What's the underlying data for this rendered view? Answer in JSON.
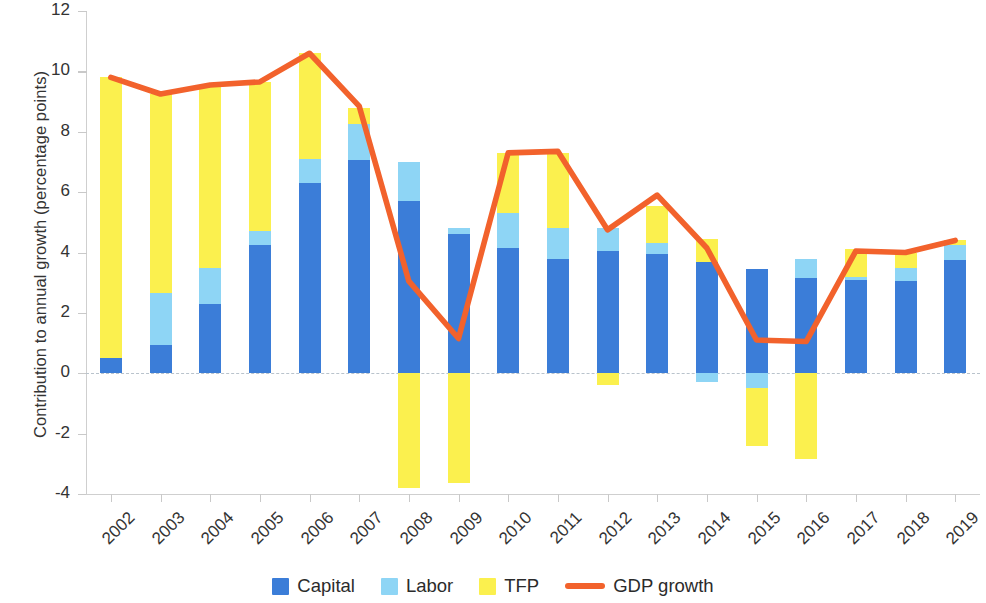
{
  "chart_data": {
    "type": "bar",
    "subtype": "stacked-bar-with-line",
    "title": "",
    "xlabel": "",
    "ylabel": "Contribution to annual growth (percentage points)",
    "ylim": [
      -4,
      12
    ],
    "yticks": [
      -4,
      -2,
      0,
      2,
      4,
      6,
      8,
      10,
      12
    ],
    "ytick_labels": [
      "-4",
      "-2",
      "0",
      "2",
      "4",
      "6",
      "8",
      "10",
      "12"
    ],
    "grid": false,
    "zero_line": true,
    "legend_position": "bottom",
    "categories": [
      "2002",
      "2003",
      "2004",
      "2005",
      "2006",
      "2007",
      "2008",
      "2009",
      "2010",
      "2011",
      "2012",
      "2013",
      "2014",
      "2015",
      "2016",
      "2017",
      "2018",
      "2019"
    ],
    "series": [
      {
        "name": "Capital",
        "type": "bar",
        "color": "#3b7dd8",
        "values": [
          0.5,
          0.95,
          2.3,
          4.25,
          6.3,
          7.05,
          5.7,
          4.6,
          4.15,
          3.8,
          4.05,
          3.95,
          3.7,
          3.45,
          3.15,
          3.1,
          3.05,
          3.75
        ]
      },
      {
        "name": "Labor",
        "type": "bar",
        "color": "#8ed5f5",
        "values": [
          0.0,
          1.7,
          1.2,
          0.45,
          0.8,
          1.2,
          1.3,
          0.2,
          1.15,
          1.0,
          0.75,
          0.35,
          -0.3,
          -0.5,
          0.65,
          0.1,
          0.45,
          0.5
        ]
      },
      {
        "name": "TFP",
        "type": "bar",
        "color": "#fbf04e",
        "values": [
          9.3,
          6.6,
          6.05,
          4.95,
          3.5,
          0.55,
          -3.8,
          -3.65,
          2.0,
          2.5,
          -0.4,
          1.25,
          0.75,
          -1.9,
          -2.85,
          0.9,
          0.5,
          0.15
        ]
      },
      {
        "name": "GDP growth",
        "type": "line",
        "color": "#f2622c",
        "values": [
          9.8,
          9.25,
          9.55,
          9.65,
          10.6,
          8.85,
          3.05,
          1.15,
          7.3,
          7.35,
          4.75,
          5.9,
          4.15,
          1.1,
          1.05,
          4.05,
          4.0,
          4.4
        ]
      }
    ]
  },
  "legend": {
    "items": [
      {
        "label": "Capital",
        "marker": "square-swatch",
        "color": "#3b7dd8"
      },
      {
        "label": "Labor",
        "marker": "square-swatch",
        "color": "#8ed5f5"
      },
      {
        "label": "TFP",
        "marker": "square-swatch",
        "color": "#fbf04e"
      },
      {
        "label": "GDP growth",
        "marker": "line-swatch",
        "color": "#f2622c"
      }
    ]
  }
}
